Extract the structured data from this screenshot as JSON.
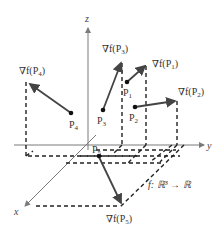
{
  "figure": {
    "function_label": "f: ℝ³ → ℝ",
    "axes": {
      "x": "x",
      "y": "y",
      "z": "z"
    },
    "points": [
      {
        "id": "P1",
        "label": "P",
        "sub": "1",
        "gradient_label": "∇f(P",
        "gradient_sub": "1"
      },
      {
        "id": "P2",
        "label": "P",
        "sub": "2",
        "gradient_label": "∇f(P",
        "gradient_sub": "2"
      },
      {
        "id": "P3",
        "label": "P",
        "sub": "3",
        "gradient_label": "∇f(P",
        "gradient_sub": "3"
      },
      {
        "id": "P4",
        "label": "P",
        "sub": "4",
        "gradient_label": "∇f(P",
        "gradient_sub": "4"
      },
      {
        "id": "P5",
        "label": "P",
        "sub": "5",
        "gradient_label": "∇f(P",
        "gradient_sub": "5"
      }
    ],
    "colors": {
      "axis": "#7a7a7a",
      "vector": "#444444",
      "dash": "#222222",
      "text": "#333333"
    }
  }
}
